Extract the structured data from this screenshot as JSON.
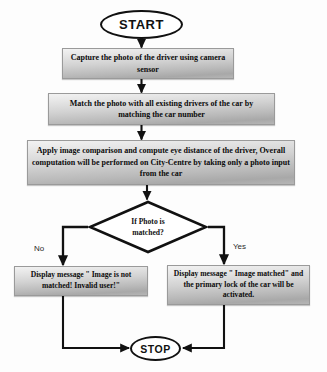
{
  "diagram": {
    "type": "flowchart",
    "orientation": "top-to-bottom",
    "nodes": {
      "start": {
        "shape": "terminator",
        "label": "START"
      },
      "capture": {
        "shape": "process",
        "label": "Capture the photo of the driver using camera sensor"
      },
      "match": {
        "shape": "process",
        "label": "Match the photo with all existing drivers of the car by matching the car number"
      },
      "apply": {
        "shape": "process",
        "label": "Apply image comparison and compute eye distance of the driver, Overall computation will be performed on City-Centre by taking only a photo input from the car"
      },
      "decision": {
        "shape": "decision",
        "line1": "If Photo is",
        "line2": "matched?"
      },
      "not_matched": {
        "shape": "process",
        "label": "Display message \" Image is not matched! Invalid user!\""
      },
      "matched": {
        "shape": "process",
        "label": "Display message \" Image matched\" and the primary lock of the car will be activated."
      },
      "stop": {
        "shape": "terminator",
        "label": "STOP"
      }
    },
    "branch_labels": {
      "no": "No",
      "yes": "Yes"
    },
    "colors": {
      "outline": "#111111",
      "process_fill_light": "#f2f2f2",
      "process_fill_dark": "#a8a8a8",
      "text": "#0b0b0b",
      "background": "#fdfdfd"
    }
  }
}
